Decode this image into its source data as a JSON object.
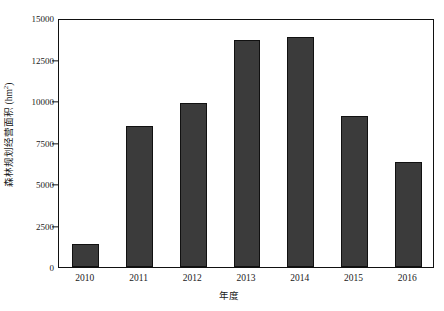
{
  "chart_data": {
    "type": "bar",
    "title": "",
    "subtitle": "",
    "xlabel": "年度",
    "ylabel_main": "森林规划经营面积 (hm",
    "ylabel_sup": "2",
    "ylabel_tail": ")",
    "ylabel_full": "森林规划经营面积 (hm²)",
    "categories": [
      "2010",
      "2011",
      "2012",
      "2013",
      "2014",
      "2015",
      "2016"
    ],
    "values": [
      1400,
      8500,
      9900,
      13700,
      13850,
      9100,
      6350
    ],
    "series": [
      {
        "name": "森林规划经营面积",
        "values": [
          1400,
          8500,
          9900,
          13700,
          13850,
          9100,
          6350
        ]
      }
    ],
    "ylim": [
      0,
      15000
    ],
    "ytick_values": [
      0,
      2500,
      5000,
      7500,
      10000,
      12500,
      15000
    ],
    "ytick_labels": [
      "0",
      "2500",
      "5000",
      "7500",
      "10000",
      "12500",
      "15000"
    ],
    "xtick_labels": [
      "2010",
      "2011",
      "2012",
      "2013",
      "2014",
      "2015",
      "2016"
    ],
    "grid": false,
    "legend": false,
    "legend_position": "none",
    "bar_color": "#3b3b3b",
    "bar_edge_color": "#111111",
    "axis_color": "#111111",
    "background_color": "#ffffff"
  }
}
